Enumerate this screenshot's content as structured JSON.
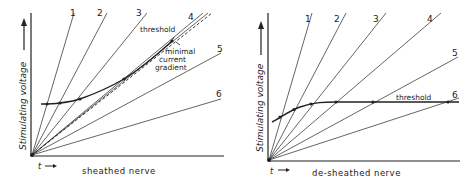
{
  "panels": [
    {
      "id": "sheathed",
      "xlabel": "sheathed nerve",
      "ylabel": "Stimulating voltage",
      "time_label": "t",
      "line_labels": [
        "1",
        "2",
        "3",
        "4",
        "5",
        "6"
      ],
      "annotations": {
        "threshold": "threshold",
        "gradient_line1": "minimal",
        "gradient_line2": "current",
        "gradient_line3": "gradient"
      }
    },
    {
      "id": "de-sheathed",
      "xlabel": "de-sheathed nerve",
      "ylabel": "Stimulating voltage",
      "time_label": "t",
      "line_labels": [
        "1",
        "2",
        "3",
        "4",
        "5",
        "6"
      ],
      "annotations": {
        "threshold": "threshold"
      }
    }
  ],
  "colors": {
    "ink": "#222222",
    "background": "#ffffff"
  }
}
